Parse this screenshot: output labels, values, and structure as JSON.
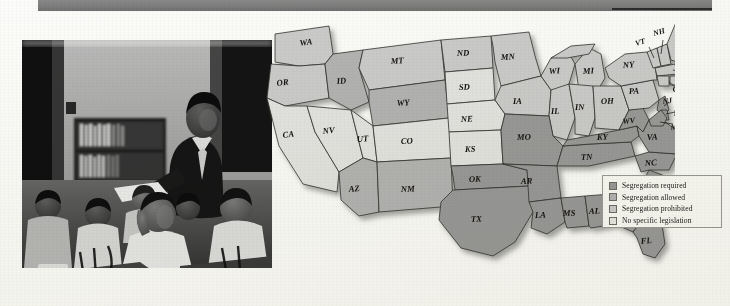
{
  "banner": {
    "title": "",
    "accent_color": "#7c7c7c"
  },
  "photo": {
    "caption": "",
    "alt_name": "classroom-photograph",
    "description": "Black-and-white photograph of an African American classroom: a teacher stands at a desk beside a bookshelf while seated students work at wooden desks"
  },
  "map": {
    "title": "",
    "shadow": true,
    "colors": {
      "required": "#9a9a9a",
      "allowed": "#b4b4b4",
      "prohibited": "#cccccc",
      "none": "#e4e4e2",
      "border": "#3a3a38",
      "outline": "#2b2b29"
    },
    "legend": {
      "items": [
        {
          "label": "Segregation required",
          "swatch": "#9a9a9a",
          "key": "required"
        },
        {
          "label": "Segregation allowed",
          "swatch": "#b4b4b4",
          "key": "allowed"
        },
        {
          "label": "Segregation prohibited",
          "swatch": "#cccccc",
          "key": "prohibited"
        },
        {
          "label": "No specific legislation",
          "swatch": "#e8e8e6",
          "key": "none"
        }
      ]
    },
    "states": [
      {
        "code": "WA",
        "status": "prohibited"
      },
      {
        "code": "OR",
        "status": "prohibited"
      },
      {
        "code": "ID",
        "status": "allowed"
      },
      {
        "code": "MT",
        "status": "prohibited"
      },
      {
        "code": "ND",
        "status": "prohibited"
      },
      {
        "code": "MN",
        "status": "prohibited"
      },
      {
        "code": "WI",
        "status": "prohibited"
      },
      {
        "code": "MI",
        "status": "prohibited"
      },
      {
        "code": "NY",
        "status": "prohibited"
      },
      {
        "code": "NH",
        "status": "prohibited"
      },
      {
        "code": "VT",
        "status": "prohibited"
      },
      {
        "code": "ME",
        "status": "prohibited"
      },
      {
        "code": "MA",
        "status": "prohibited"
      },
      {
        "code": "CT",
        "status": "prohibited"
      },
      {
        "code": "RI",
        "status": "prohibited"
      },
      {
        "code": "NJ",
        "status": "prohibited"
      },
      {
        "code": "PA",
        "status": "prohibited"
      },
      {
        "code": "IL",
        "status": "prohibited"
      },
      {
        "code": "IN",
        "status": "prohibited"
      },
      {
        "code": "OH",
        "status": "prohibited"
      },
      {
        "code": "IA",
        "status": "prohibited"
      },
      {
        "code": "CA",
        "status": "none"
      },
      {
        "code": "NV",
        "status": "none"
      },
      {
        "code": "UT",
        "status": "none"
      },
      {
        "code": "CO",
        "status": "none"
      },
      {
        "code": "SD",
        "status": "none"
      },
      {
        "code": "NE",
        "status": "none"
      },
      {
        "code": "KS",
        "status": "none"
      },
      {
        "code": "WY",
        "status": "allowed"
      },
      {
        "code": "AZ",
        "status": "allowed"
      },
      {
        "code": "NM",
        "status": "allowed"
      },
      {
        "code": "MO",
        "status": "required"
      },
      {
        "code": "OK",
        "status": "required"
      },
      {
        "code": "TX",
        "status": "required"
      },
      {
        "code": "AR",
        "status": "required"
      },
      {
        "code": "LA",
        "status": "required"
      },
      {
        "code": "MS",
        "status": "required"
      },
      {
        "code": "AL",
        "status": "required"
      },
      {
        "code": "GA",
        "status": "required"
      },
      {
        "code": "FL",
        "status": "required"
      },
      {
        "code": "TN",
        "status": "required"
      },
      {
        "code": "KY",
        "status": "required"
      },
      {
        "code": "WV",
        "status": "required"
      },
      {
        "code": "VA",
        "status": "required"
      },
      {
        "code": "NC",
        "status": "required"
      },
      {
        "code": "SC",
        "status": "required"
      },
      {
        "code": "DE",
        "status": "required"
      },
      {
        "code": "MD",
        "status": "required"
      }
    ]
  }
}
